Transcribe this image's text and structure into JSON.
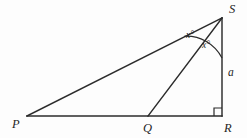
{
  "figure": {
    "kind": "euclidean-geometry-diagram",
    "background_color": "#fdfdfd",
    "ink_color": "#2b2b2b",
    "width": 247,
    "height": 138,
    "vertices": [
      {
        "id": "S",
        "label": "S",
        "x": 222,
        "y": 18,
        "label_x": 229,
        "label_y": 3
      },
      {
        "id": "P",
        "label": "P",
        "x": 27,
        "y": 116,
        "label_x": 12,
        "label_y": 118
      },
      {
        "id": "Q",
        "label": "Q",
        "x": 148,
        "y": 116,
        "label_x": 143,
        "label_y": 122
      },
      {
        "id": "R",
        "label": "R",
        "x": 222,
        "y": 116,
        "label_x": 224,
        "label_y": 122
      }
    ],
    "segments": [
      {
        "id": "PS",
        "from": "P",
        "to": "S",
        "name": "hypotenuse-p-s"
      },
      {
        "id": "PR",
        "from": "P",
        "to": "R",
        "name": "base-p-r"
      },
      {
        "id": "SR",
        "from": "S",
        "to": "R",
        "name": "vertical-s-r"
      },
      {
        "id": "SQ",
        "from": "S",
        "to": "Q",
        "name": "cevian-s-q"
      }
    ],
    "angle_marks": [
      {
        "id": "angle-PSQ",
        "label": "x°",
        "label_x": 186,
        "label_y": 31
      },
      {
        "id": "angle-QSR",
        "label": "x°",
        "label_x": 202,
        "label_y": 41
      }
    ],
    "arc": {
      "center": "S",
      "radius": 40,
      "start_x": 184.2,
      "start_y": 36.2,
      "end_x": 222,
      "end_y": 58
    },
    "right_angle": {
      "at": "R",
      "size": 8,
      "x": 214,
      "y": 108
    },
    "side_labels": [
      {
        "id": "side-a",
        "label": "a",
        "for_segment": "SR",
        "label_x": 228,
        "label_y": 67
      }
    ]
  }
}
